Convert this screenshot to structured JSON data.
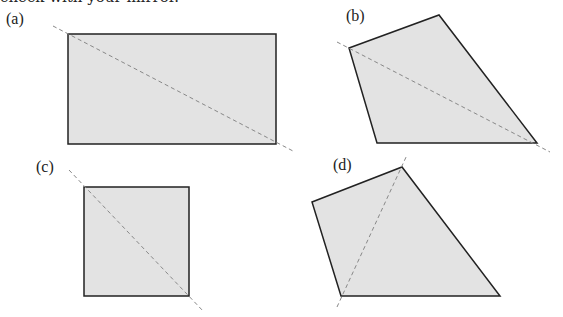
{
  "header": {
    "partial_text": "check with your mirror."
  },
  "figures": [
    {
      "label": "(a)",
      "shape": "rectangle",
      "points": [
        [
          68,
          34
        ],
        [
          276,
          34
        ],
        [
          276,
          144
        ],
        [
          68,
          144
        ]
      ],
      "line": [
        [
          53,
          26
        ],
        [
          293,
          151
        ]
      ]
    },
    {
      "label": "(b)",
      "shape": "quadrilateral",
      "points": [
        [
          349,
          48
        ],
        [
          439,
          15
        ],
        [
          537,
          143
        ],
        [
          377,
          143
        ]
      ],
      "line": [
        [
          337,
          42
        ],
        [
          550,
          152
        ]
      ]
    },
    {
      "label": "(c)",
      "shape": "square",
      "points": [
        [
          84,
          187
        ],
        [
          189,
          187
        ],
        [
          189,
          296
        ],
        [
          84,
          296
        ]
      ],
      "line": [
        [
          69,
          170
        ],
        [
          204,
          312
        ]
      ]
    },
    {
      "label": "(d)",
      "shape": "quadrilateral",
      "points": [
        [
          312,
          202
        ],
        [
          402,
          167
        ],
        [
          500,
          296
        ],
        [
          341,
          296
        ]
      ],
      "line": [
        [
          337,
          307
        ],
        [
          407,
          155
        ]
      ]
    }
  ],
  "colors": {
    "fill": "#e3e3e3",
    "stroke": "#222222",
    "dash": "#888888"
  }
}
